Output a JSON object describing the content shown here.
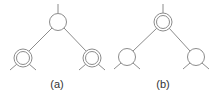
{
  "colors": {
    "stroke": "#8c8c8c",
    "text": "#333333",
    "background": "#ffffff"
  },
  "panels": [
    {
      "label": "(a)",
      "description": "Binary tree fragment: single-circle root, double-circle children",
      "root": {
        "style": "single"
      },
      "children": [
        {
          "style": "double"
        },
        {
          "style": "double"
        }
      ]
    },
    {
      "label": "(b)",
      "description": "Binary tree fragment: double-circle root, single-circle children",
      "root": {
        "style": "double"
      },
      "children": [
        {
          "style": "single"
        },
        {
          "style": "single"
        }
      ]
    }
  ]
}
